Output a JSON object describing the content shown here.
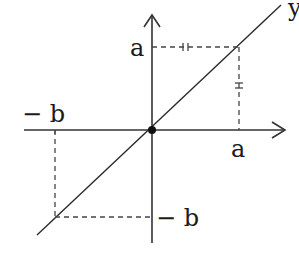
{
  "diagram": {
    "type": "coordinate-plot",
    "labels": {
      "y_axis": "y",
      "a_on_y": "a",
      "a_on_x": "a",
      "neg_b_on_x": "− b",
      "neg_b_on_y": "− b"
    },
    "points": [
      {
        "name": "origin",
        "x": 0,
        "y": 0
      },
      {
        "name": "point-a-a",
        "x": "a",
        "y": "a"
      },
      {
        "name": "point-neg-b-neg-b",
        "x": "-b",
        "y": "-b"
      }
    ],
    "equal_marks": [
      "horizontal dashed segment at y=a",
      "vertical dashed segment at x=a"
    ],
    "colors": {
      "line": "#2a2a2a",
      "axis": "#333333",
      "dash": "#444444",
      "background": "#ffffff"
    }
  }
}
